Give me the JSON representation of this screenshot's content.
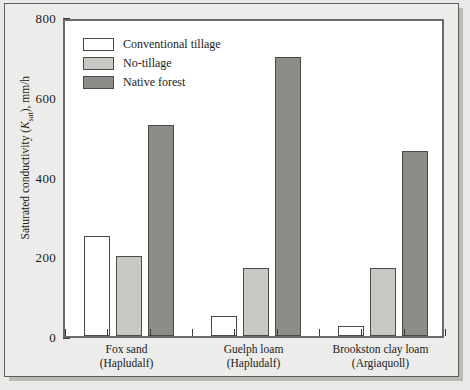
{
  "chart_data": {
    "type": "bar",
    "title": "",
    "xlabel": "",
    "ylabel": "Saturated conductivity (Ksat), mm/h",
    "ylabel_parts": {
      "prefix": "Saturated conductivity (",
      "symbol": "K",
      "subscript": "sat",
      "suffix": "), mm/h"
    },
    "categories": [
      "Fox sand\n(Hapludalf)",
      "Guelph loam\n(Hapludalf)",
      "Brookston clay loam\n(Argiaquoll)"
    ],
    "category_lines": [
      [
        "Fox sand",
        "(Hapludalf)"
      ],
      [
        "Guelph loam",
        "(Hapludalf)"
      ],
      [
        "Brookston clay loam",
        "(Argiaquoll)"
      ]
    ],
    "series": [
      {
        "name": "Conventional tillage",
        "key": "conventional",
        "color": "#ffffff",
        "values": [
          250,
          50,
          25
        ]
      },
      {
        "name": "No-tillage",
        "key": "notillage",
        "color": "#c8c8c4",
        "values": [
          200,
          170,
          170
        ]
      },
      {
        "name": "Native forest",
        "key": "forest",
        "color": "#8c8c88",
        "values": [
          530,
          700,
          465
        ]
      }
    ],
    "ylim": [
      0,
      800
    ],
    "yticks": [
      0,
      200,
      400,
      600,
      800
    ],
    "ytick_labels": [
      "0",
      "200",
      "400",
      "600",
      "800"
    ],
    "grid": false,
    "legend_position": "top-left"
  }
}
